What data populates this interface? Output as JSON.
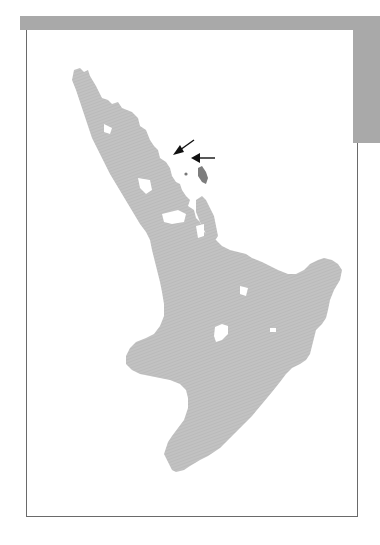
{
  "figure": {
    "type": "map",
    "region": "North Island, New Zealand",
    "colors": {
      "land": "#bdbdbd",
      "highlight_island": "#7d7d7d",
      "header_bar": "#a9a9a9",
      "frame_border": "#6a6a6a",
      "arrow": "#111111"
    },
    "annotations": [
      {
        "type": "arrow",
        "direction": "down-left",
        "label": ""
      },
      {
        "type": "arrow",
        "direction": "left",
        "label": ""
      }
    ],
    "features": [
      {
        "name": "land-mass",
        "description": "North Island outline"
      },
      {
        "name": "lake",
        "description": "central lake (white)"
      },
      {
        "name": "offshore-island",
        "description": "small darker island near arrows"
      }
    ]
  }
}
